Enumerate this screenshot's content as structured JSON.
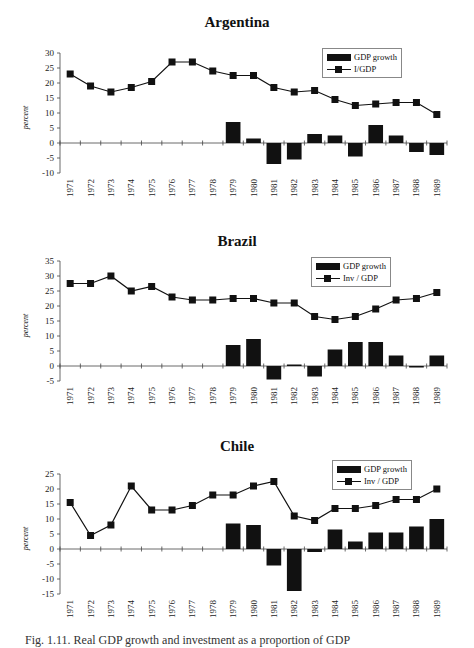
{
  "caption": "Fig. 1.11. Real GDP growth and investment as a proportion of GDP",
  "chart_data": [
    {
      "type": "bar+line",
      "title": "Argentina",
      "ylabel": "percent",
      "xlabel": "",
      "ylim": [
        -10,
        30
      ],
      "yticks": [
        30,
        25,
        20,
        15,
        10,
        5,
        0,
        -5,
        -10
      ],
      "legend_position": "top-right",
      "categories": [
        "1971",
        "1972",
        "1973",
        "1974",
        "1975",
        "1976",
        "1977",
        "1978",
        "1979",
        "1980",
        "1981",
        "1982",
        "1983",
        "1984",
        "1985",
        "1986",
        "1987",
        "1988",
        "1989"
      ],
      "series": [
        {
          "name": "GDP growth",
          "type": "bar",
          "values": [
            null,
            null,
            null,
            null,
            null,
            null,
            null,
            null,
            7,
            1.5,
            -7,
            -5.5,
            3,
            2.5,
            -4.5,
            6,
            2.5,
            -3,
            -4
          ]
        },
        {
          "name": "I/GDP",
          "type": "line",
          "values": [
            23,
            19,
            17,
            18.5,
            20.5,
            27,
            27,
            24,
            22.5,
            22.5,
            18.5,
            17,
            17.5,
            14.5,
            12.5,
            13,
            13.5,
            13.5,
            9.5
          ]
        }
      ]
    },
    {
      "type": "bar+line",
      "title": "Brazil",
      "ylabel": "percent",
      "xlabel": "",
      "ylim": [
        -5,
        35
      ],
      "yticks": [
        35,
        30,
        25,
        20,
        15,
        10,
        5,
        0,
        -5
      ],
      "legend_position": "top-right",
      "categories": [
        "1971",
        "1972",
        "1973",
        "1974",
        "1975",
        "1976",
        "1977",
        "1978",
        "1979",
        "1980",
        "1981",
        "1982",
        "1983",
        "1984",
        "1985",
        "1986",
        "1987",
        "1988",
        "1989"
      ],
      "series": [
        {
          "name": "GDP growth",
          "type": "bar",
          "values": [
            null,
            null,
            null,
            null,
            null,
            null,
            null,
            null,
            7,
            9,
            -4.5,
            0.5,
            -3.5,
            5.5,
            8,
            8,
            3.5,
            -0.5,
            3.5
          ]
        },
        {
          "name": "Inv / GDP",
          "type": "line",
          "values": [
            27.5,
            27.5,
            30,
            25,
            26.5,
            23,
            22,
            22,
            22.5,
            22.5,
            21,
            21,
            16.5,
            15.5,
            16.5,
            19,
            22,
            22.5,
            24.5
          ]
        }
      ]
    },
    {
      "type": "bar+line",
      "title": "Chile",
      "ylabel": "percent",
      "xlabel": "",
      "ylim": [
        -15,
        25
      ],
      "yticks": [
        25,
        20,
        15,
        10,
        5,
        0,
        -5,
        -10,
        -15
      ],
      "legend_position": "top-right",
      "categories": [
        "1971",
        "1972",
        "1973",
        "1974",
        "1975",
        "1976",
        "1977",
        "1978",
        "1979",
        "1980",
        "1981",
        "1982",
        "1983",
        "1984",
        "1985",
        "1986",
        "1987",
        "1988",
        "1989"
      ],
      "series": [
        {
          "name": "GDP growth",
          "type": "bar",
          "values": [
            null,
            null,
            null,
            null,
            null,
            null,
            null,
            null,
            8.5,
            8,
            -5.5,
            -14,
            -1,
            6.5,
            2.5,
            5.5,
            5.5,
            7.5,
            10
          ]
        },
        {
          "name": "Inv / GDP",
          "type": "line",
          "values": [
            15.5,
            4.5,
            8,
            21,
            13,
            13,
            14.5,
            18,
            18,
            21,
            22.5,
            11,
            9.5,
            13.5,
            13.5,
            14.5,
            16.5,
            16.5,
            20
          ]
        }
      ]
    }
  ],
  "layout": [
    {
      "top": 0,
      "titleTop": 14,
      "legendLeft": 322,
      "legendTop": 48,
      "ymax": 30,
      "ymin": -10,
      "y0px": 53
    },
    {
      "top": 225,
      "titleTop": 8,
      "legendLeft": 311,
      "legendTop": 32,
      "ymax": 35,
      "ymin": -5,
      "y0px": 36
    },
    {
      "top": 430,
      "titleTop": 8,
      "legendLeft": 332,
      "legendTop": 30,
      "ymax": 25,
      "ymin": -15,
      "y0px": 44
    }
  ]
}
